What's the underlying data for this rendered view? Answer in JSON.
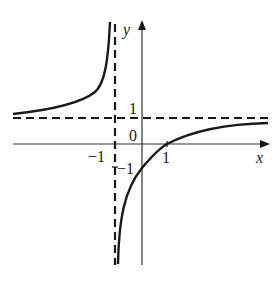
{
  "figure": {
    "type": "function-graph",
    "function": "y = (x-1)/(x+1)",
    "axes": {
      "x_label": "x",
      "y_label": "y",
      "origin_label": "0"
    },
    "tick_labels": {
      "x_neg_one": "−1",
      "x_one": "1",
      "y_one": "1",
      "y_neg_one": "−1"
    },
    "asymptotes": {
      "vertical": "x = -1",
      "horizontal": "y = 1"
    },
    "colors": {
      "curve": "#1a1a1a",
      "axes": "#333333",
      "asymptote": "#1a1a1a",
      "background": "#ffffff"
    }
  }
}
